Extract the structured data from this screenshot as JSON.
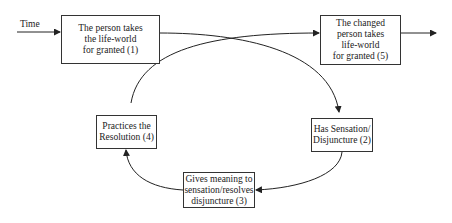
{
  "diagram": {
    "time_label": "Time",
    "nodes": [
      {
        "id": 1,
        "text": "The person takes\nthe life-world\nfor granted (1)"
      },
      {
        "id": 2,
        "text": "Has Sensation/\nDisjuncture (2)"
      },
      {
        "id": 3,
        "text": "Gives meaning to\nsensation/resolves\ndisjuncture (3)"
      },
      {
        "id": 4,
        "text": "Practices the\nResolution (4)"
      },
      {
        "id": 5,
        "text": "The changed\nperson takes\nlife-world\nfor granted (5)"
      }
    ],
    "edges": [
      {
        "from": "Time",
        "to": 1
      },
      {
        "from": 1,
        "to": 2
      },
      {
        "from": 2,
        "to": 3
      },
      {
        "from": 3,
        "to": 4
      },
      {
        "from": 4,
        "to": 5
      },
      {
        "from": 5,
        "to": "out"
      }
    ]
  }
}
